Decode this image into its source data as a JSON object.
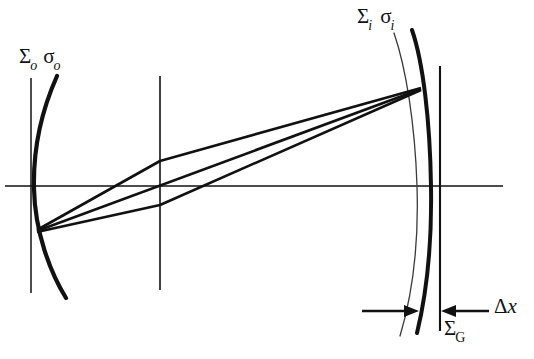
{
  "figure": {
    "type": "optical-ray-diagram",
    "background_color": "#ffffff",
    "stroke_color": "#111111",
    "thin_stroke_color": "#3a3a3a",
    "labels": {
      "object_surface": {
        "sigma_upper": "Σ",
        "sigma_upper_sub": "o",
        "sigma_lower": "σ",
        "sigma_lower_sub": "o"
      },
      "image_surface": {
        "sigma_upper": "Σ",
        "sigma_upper_sub": "i",
        "sigma_lower": "σ",
        "sigma_lower_sub": "i"
      },
      "gaussian_surface": {
        "sigma_upper": "Σ",
        "sigma_upper_sub": "G"
      },
      "displacement": {
        "delta": "Δ",
        "variable": "x"
      }
    },
    "caption_partial": "",
    "optical_axis": {
      "y": 186,
      "x_start": 5,
      "x_end": 503
    },
    "vertical_reference_lines": [
      {
        "name": "object-plane-line",
        "x": 31,
        "y_top": 78,
        "y_bottom": 293
      },
      {
        "name": "center-plane-line",
        "x": 160,
        "y_top": 76,
        "y_bottom": 290
      },
      {
        "name": "gaussian-plane-line",
        "x": 440,
        "y_top": 66,
        "y_bottom": 331
      }
    ],
    "curves": [
      {
        "name": "object-surface-curve",
        "weight": "thick",
        "path": "M 57 76 C 41 112, 33 152, 34 189 C 35 232, 50 272, 66 298"
      },
      {
        "name": "image-surface-curve-thick",
        "weight": "thick",
        "path": "M 412 30 C 423 62, 430 120, 431 186 C 432 246, 427 292, 417 333"
      },
      {
        "name": "image-surface-curve-thin",
        "weight": "thin",
        "path": "M 394 33 C 406 68, 415 124, 417 186 C 419 248, 412 296, 400 336"
      }
    ],
    "rays": [
      {
        "name": "ray-upper",
        "x1": 37,
        "y1": 230,
        "x2": 421,
        "y2": 88
      },
      {
        "name": "ray-middle",
        "x1": 37,
        "y1": 231,
        "x2": 421,
        "y2": 89
      },
      {
        "name": "ray-lower",
        "x1": 37,
        "y1": 232,
        "x2": 421,
        "y2": 90
      },
      {
        "name": "ray-fold-upper",
        "x1": 421,
        "y1": 88,
        "x2": 37,
        "y2": 231
      },
      {
        "name": "ray-fold-lower",
        "x1": 421,
        "y1": 90,
        "x2": 37,
        "y2": 231
      }
    ],
    "ray_fan_upper_bend": {
      "x": 160,
      "y": 161
    },
    "ray_fan_lower_bend": {
      "x": 160,
      "y": 205
    },
    "arrows": [
      {
        "name": "delta-x-arrow-left",
        "x_tail": 362,
        "x_head": 417,
        "y": 311,
        "direction": "right"
      },
      {
        "name": "delta-x-arrow-right",
        "x_tail": 489,
        "x_head": 443,
        "y": 311,
        "direction": "left"
      }
    ]
  }
}
